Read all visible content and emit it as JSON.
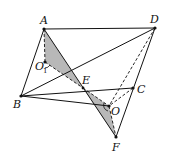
{
  "diagram": {
    "type": "geometry-figure",
    "points": {
      "A": {
        "label": "A",
        "x": 44,
        "y": 29
      },
      "D": {
        "label": "D",
        "x": 155,
        "y": 28
      },
      "B": {
        "label": "B",
        "x": 21,
        "y": 96
      },
      "C": {
        "label": "C",
        "x": 133,
        "y": 88
      },
      "E": {
        "label": "E",
        "x": 83,
        "y": 88
      },
      "O": {
        "label": "O",
        "x": 109,
        "y": 106
      },
      "O1": {
        "label": "O",
        "sub": "1",
        "x": 45,
        "y": 62
      },
      "F": {
        "label": "F",
        "x": 116,
        "y": 137
      }
    },
    "solid_segments": [
      [
        "A",
        "D"
      ],
      [
        "A",
        "B"
      ],
      [
        "B",
        "D"
      ],
      [
        "B",
        "C"
      ],
      [
        "A",
        "F"
      ],
      [
        "B",
        "O"
      ],
      [
        "D",
        "F"
      ],
      [
        "C",
        "F"
      ]
    ],
    "dashed_segments": [
      [
        "A",
        "O1"
      ],
      [
        "O1",
        "E"
      ],
      [
        "D",
        "O"
      ],
      [
        "C",
        "O"
      ],
      [
        "E",
        "O"
      ],
      [
        "O",
        "F"
      ]
    ],
    "shaded_regions": [
      [
        "A",
        "O1",
        "E"
      ],
      [
        "E",
        "O",
        "F"
      ]
    ],
    "colors": {
      "stroke": "#111111",
      "shade": "#b8b8b8"
    }
  }
}
